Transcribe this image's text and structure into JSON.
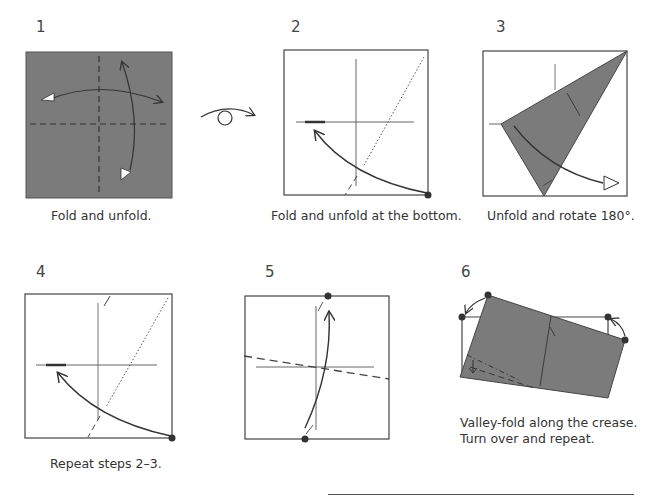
{
  "steps": [
    {
      "number": "1",
      "caption": "Fold and unfold."
    },
    {
      "number": "2",
      "caption": "Fold and unfold at the bottom."
    },
    {
      "number": "3",
      "caption": "Unfold and rotate 180°."
    },
    {
      "number": "4",
      "caption": "Repeat steps 2–3."
    },
    {
      "number": "5",
      "caption": ""
    },
    {
      "number": "6",
      "caption_line1": "Valley-fold along the crease.",
      "caption_line2": "Turn over and repeat."
    }
  ],
  "symbols": {
    "turn_over": "turn-over-icon"
  },
  "colors": {
    "paper_colored": "#7b7b7b",
    "line": "#333333",
    "background": "#ffffff"
  }
}
